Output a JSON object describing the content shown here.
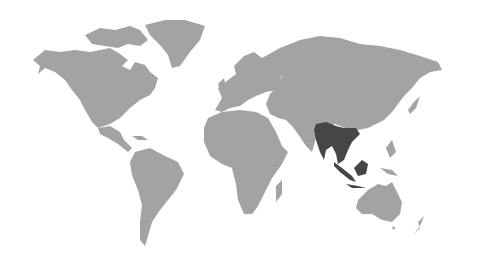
{
  "map": {
    "type": "world-map",
    "colors": {
      "background": "#ffffff",
      "land": "#a3a3a3",
      "highlight": "#454545"
    },
    "highlighted_region": "Southeast Asia",
    "highlighted_countries": [
      "Myanmar",
      "Thailand",
      "Laos",
      "Cambodia",
      "Vietnam",
      "Malaysia",
      "Singapore",
      "Indonesia (Sumatra, Borneo, Java)",
      "Brunei"
    ]
  }
}
